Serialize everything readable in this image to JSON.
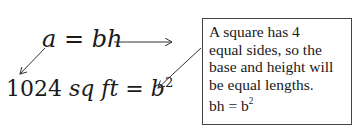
{
  "equations": {
    "area_formula": {
      "a": "a",
      "eq": " = ",
      "bh": "bh"
    },
    "substituted": {
      "num": "1024",
      "unit_sq": " sq",
      "unit_ft": " ft",
      "eq": " = ",
      "b": "b",
      "exp": "2"
    }
  },
  "note": {
    "lines": [
      "A square has 4",
      "equal sides, so the",
      "base and height will",
      "be equal lengths."
    ],
    "formula": {
      "bh": "bh = b",
      "exp": "2"
    }
  }
}
